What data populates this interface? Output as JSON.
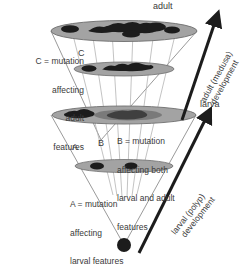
{
  "figure": {
    "type": "developmental-fate-cone-diagram",
    "background_color": "#ffffff",
    "ellipse_fill": "#a3a3a3",
    "ellipse_stroke": "#6e6e6e",
    "blob_color": "#1c1c1c",
    "line_color": "#9a9a9a",
    "arrow_color": "#1c1c1c",
    "text_color": "#3a3a3a"
  },
  "stage_labels": {
    "adult": "adult",
    "larva": "larva"
  },
  "axis_labels": {
    "adult_development_line1": "adult (medusa)",
    "adult_development_line2": "development",
    "larval_development_line1": "larval (polyp)",
    "larval_development_line2": "development"
  },
  "markers": {
    "a": "A",
    "b": "B",
    "c": "C"
  },
  "legend": {
    "c": {
      "line1": "C = mutation",
      "line2": "affecting",
      "line3": "adult",
      "line4": "features"
    },
    "b": {
      "line1": "B = mutation",
      "line2": "affecting both",
      "line3": "larval and adult",
      "line4": "features"
    },
    "a": {
      "line1": "A = mutation",
      "line2": "affecting",
      "line3": "larval features"
    }
  },
  "levels": [
    {
      "name": "adult-top-disc",
      "cy": 31,
      "rx": 73,
      "ry": 10,
      "blob_count": 6
    },
    {
      "name": "adult-mid-disc",
      "cy": 69,
      "rx": 50,
      "ry": 7,
      "blob_count": 4
    },
    {
      "name": "larva-disc",
      "cy": 115,
      "rx": 72,
      "ry": 9,
      "blob_count": 3
    },
    {
      "name": "larva-early-disc",
      "cy": 166,
      "rx": 49,
      "ry": 6,
      "blob_count": 2
    },
    {
      "name": "zygote",
      "cy": 245,
      "rx": 7,
      "ry": 7,
      "blob_count": 1
    }
  ]
}
